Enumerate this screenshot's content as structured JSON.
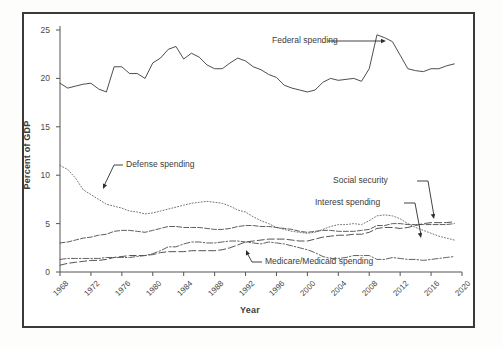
{
  "figure": {
    "background": "#ffffff",
    "border_color": "#3a3a3a"
  },
  "axes": {
    "ylabel": "Percent of GDP",
    "xlabel": "Year",
    "y_ticks": [
      "0",
      "5",
      "10",
      "15",
      "20",
      "25"
    ],
    "x_ticks": [
      "1968",
      "1972",
      "1976",
      "1980",
      "1984",
      "1988",
      "1992",
      "1996",
      "2000",
      "2004",
      "2008",
      "2012",
      "2016",
      "2020"
    ]
  },
  "annotations": {
    "federal": "Federal spending",
    "defense": "Defense spending",
    "social_security": "Social security",
    "interest": "Interest spending",
    "medicare": "Medicare/Medicaid spending"
  },
  "chart_data": {
    "type": "line",
    "title": "",
    "xlabel": "Year",
    "ylabel": "Percent of GDP",
    "xlim": [
      1968,
      2020
    ],
    "ylim": [
      0,
      25
    ],
    "y_ticks": [
      0,
      5,
      10,
      15,
      20,
      25
    ],
    "x_ticks": [
      1968,
      1972,
      1976,
      1980,
      1984,
      1988,
      1992,
      1996,
      2000,
      2004,
      2008,
      2012,
      2016,
      2020
    ],
    "grid": false,
    "legend": "none (direct annotations with leader lines)",
    "x": [
      1968,
      1969,
      1970,
      1971,
      1972,
      1973,
      1974,
      1975,
      1976,
      1977,
      1978,
      1979,
      1980,
      1981,
      1982,
      1983,
      1984,
      1985,
      1986,
      1987,
      1988,
      1989,
      1990,
      1991,
      1992,
      1993,
      1994,
      1995,
      1996,
      1997,
      1998,
      1999,
      2000,
      2001,
      2002,
      2003,
      2004,
      2005,
      2006,
      2007,
      2008,
      2009,
      2010,
      2011,
      2012,
      2013,
      2014,
      2015,
      2016,
      2017,
      2018,
      2019
    ],
    "series": [
      {
        "name": "Federal spending",
        "style": "solid",
        "color": "#3a3a3a",
        "values": [
          19.5,
          19.0,
          19.2,
          19.4,
          19.5,
          18.9,
          18.6,
          21.2,
          21.2,
          20.5,
          20.5,
          20.0,
          21.6,
          22.1,
          23.0,
          23.3,
          22.0,
          22.6,
          22.2,
          21.4,
          21.0,
          21.0,
          21.6,
          22.1,
          21.8,
          21.2,
          20.9,
          20.4,
          20.1,
          19.3,
          19.0,
          18.8,
          18.6,
          18.8,
          19.6,
          20.0,
          19.8,
          19.9,
          20.0,
          19.7,
          21.0,
          24.5,
          24.2,
          23.8,
          22.4,
          21.0,
          20.8,
          20.7,
          21.0,
          21.0,
          21.3,
          21.5
        ]
      },
      {
        "name": "Defense spending",
        "style": "dotted",
        "color": "#6e6e6e",
        "values": [
          11.0,
          10.6,
          9.7,
          8.5,
          8.0,
          7.5,
          7.0,
          6.8,
          6.6,
          6.3,
          6.2,
          6.0,
          6.1,
          6.3,
          6.5,
          6.7,
          6.9,
          7.1,
          7.2,
          7.3,
          7.2,
          7.1,
          6.8,
          6.4,
          6.2,
          5.7,
          5.3,
          5.0,
          4.6,
          4.4,
          4.2,
          4.1,
          4.0,
          4.1,
          4.4,
          4.7,
          4.9,
          4.9,
          5.0,
          4.9,
          5.3,
          5.8,
          5.9,
          5.8,
          5.5,
          5.0,
          4.6,
          4.3,
          4.0,
          3.7,
          3.5,
          3.3
        ]
      },
      {
        "name": "Social security",
        "style": "dashed",
        "color": "#555555",
        "values": [
          3.0,
          3.1,
          3.3,
          3.5,
          3.6,
          3.8,
          3.9,
          4.2,
          4.3,
          4.3,
          4.2,
          4.1,
          4.3,
          4.5,
          4.7,
          4.7,
          4.6,
          4.6,
          4.6,
          4.5,
          4.4,
          4.4,
          4.5,
          4.7,
          4.8,
          4.8,
          4.7,
          4.7,
          4.6,
          4.5,
          4.4,
          4.2,
          4.1,
          4.2,
          4.3,
          4.3,
          4.2,
          4.2,
          4.2,
          4.3,
          4.4,
          4.8,
          4.8,
          5.0,
          5.0,
          4.9,
          4.9,
          4.9,
          4.9,
          4.9,
          4.9,
          5.0
        ]
      },
      {
        "name": "Medicare/Medicaid spending",
        "style": "long-dash",
        "color": "#4a4a4a",
        "values": [
          0.7,
          0.9,
          1.0,
          1.1,
          1.2,
          1.2,
          1.3,
          1.5,
          1.6,
          1.7,
          1.7,
          1.7,
          1.8,
          2.0,
          2.1,
          2.1,
          2.1,
          2.2,
          2.2,
          2.2,
          2.2,
          2.3,
          2.5,
          2.8,
          3.1,
          3.2,
          3.3,
          3.4,
          3.4,
          3.4,
          3.3,
          3.2,
          3.2,
          3.4,
          3.6,
          3.7,
          3.8,
          3.8,
          3.9,
          3.9,
          4.1,
          4.5,
          4.6,
          4.6,
          4.5,
          4.6,
          4.8,
          5.0,
          5.1,
          5.1,
          5.1,
          5.2
        ]
      },
      {
        "name": "Interest spending",
        "style": "dash-dot",
        "color": "#5a5a5a",
        "values": [
          1.3,
          1.4,
          1.4,
          1.4,
          1.4,
          1.4,
          1.5,
          1.5,
          1.5,
          1.5,
          1.6,
          1.7,
          1.9,
          2.2,
          2.6,
          2.6,
          2.9,
          3.1,
          3.1,
          3.0,
          3.0,
          3.1,
          3.2,
          3.2,
          3.1,
          3.0,
          2.9,
          3.1,
          3.0,
          2.9,
          2.7,
          2.5,
          2.3,
          2.0,
          1.6,
          1.4,
          1.4,
          1.5,
          1.7,
          1.7,
          1.7,
          1.3,
          1.3,
          1.5,
          1.4,
          1.3,
          1.3,
          1.2,
          1.3,
          1.4,
          1.5,
          1.6
        ]
      }
    ]
  }
}
